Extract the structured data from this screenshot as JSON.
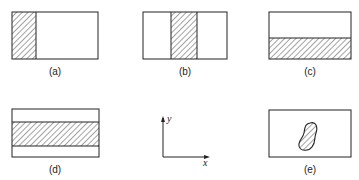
{
  "figure": {
    "panels": [
      {
        "id": "a",
        "label": "(a)",
        "description": "rectangle with left vertical strip hatched"
      },
      {
        "id": "b",
        "label": "(b)",
        "description": "rectangle with middle vertical strip hatched"
      },
      {
        "id": "c",
        "label": "(c)",
        "description": "rectangle with bottom horizontal strip hatched"
      },
      {
        "id": "d",
        "label": "(d)",
        "description": "rectangle with middle horizontal strip hatched"
      },
      {
        "id": "e",
        "label": "(e)",
        "description": "rectangle with hatched irregular blob"
      }
    ],
    "axes": {
      "x_label": "x",
      "y_label": "y"
    },
    "colors": {
      "stroke": "#222222",
      "background": "#ffffff"
    }
  }
}
